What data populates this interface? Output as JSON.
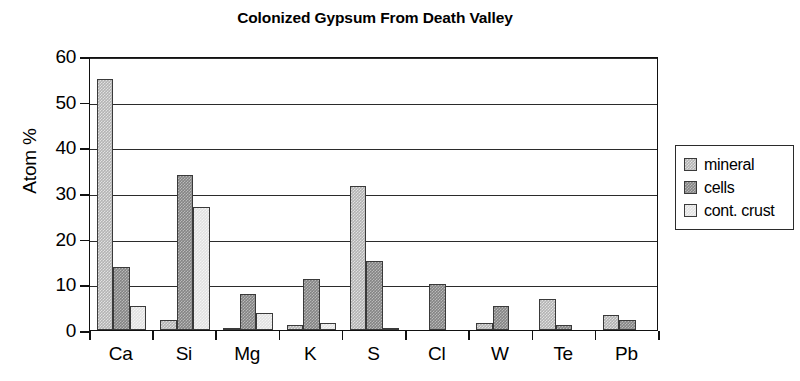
{
  "chart_data": {
    "type": "bar",
    "title": "Colonized Gypsum From Death Valley",
    "xlabel": "",
    "ylabel": "Atom %",
    "ylim": [
      0,
      60
    ],
    "ytick_labels": [
      "60",
      "50",
      "40",
      "30",
      "20",
      "10",
      "0"
    ],
    "yticks": [
      60,
      50,
      40,
      30,
      20,
      10,
      0
    ],
    "grid": true,
    "legend_position": "right-outside",
    "categories": [
      "Ca",
      "Si",
      "Mg",
      "K",
      "S",
      "Cl",
      "W",
      "Te",
      "Pb"
    ],
    "series": [
      {
        "name": "mineral",
        "color": "#b3b3b3",
        "values": [
          55.0,
          2.2,
          0.5,
          1.0,
          31.5,
          0.0,
          1.5,
          6.8,
          3.2
        ]
      },
      {
        "name": "cells",
        "color": "#848484",
        "values": [
          13.7,
          34.0,
          7.8,
          11.1,
          15.2,
          10.1,
          5.3,
          1.0,
          2.2
        ]
      },
      {
        "name": "cont. crust",
        "color": "#e2e2e2",
        "values": [
          5.3,
          27.0,
          3.7,
          1.6,
          0.5,
          0.0,
          0.0,
          0.0,
          0.0
        ]
      }
    ]
  },
  "legend": {
    "items": [
      {
        "label": "mineral"
      },
      {
        "label": "cells"
      },
      {
        "label": "cont. crust"
      }
    ]
  }
}
